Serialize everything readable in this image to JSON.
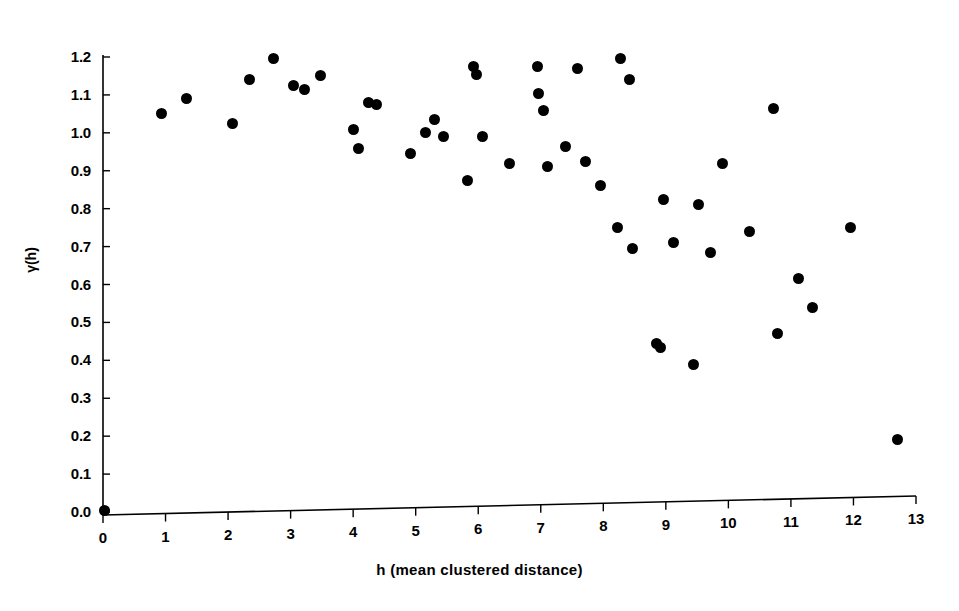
{
  "chart_data": {
    "type": "scatter",
    "title": "",
    "xlabel": "h (mean clustered distance)",
    "ylabel": "γ(h)",
    "xlim": [
      0,
      13
    ],
    "ylim": [
      0.0,
      1.2
    ],
    "grid": false,
    "legend": null,
    "xticks": [
      "0",
      "1",
      "2",
      "3",
      "4",
      "5",
      "6",
      "7",
      "8",
      "9",
      "10",
      "11",
      "12",
      "13"
    ],
    "xtick_values": [
      0,
      1,
      2,
      3,
      4,
      5,
      6,
      7,
      8,
      9,
      10,
      11,
      12,
      13
    ],
    "yticks": [
      "0.0",
      "0.1",
      "0.2",
      "0.3",
      "0.4",
      "0.5",
      "0.6",
      "0.7",
      "0.8",
      "0.9",
      "1.0",
      "1.1",
      "1.2"
    ],
    "ytick_values": [
      0.0,
      0.1,
      0.2,
      0.3,
      0.4,
      0.5,
      0.6,
      0.7,
      0.8,
      0.9,
      1.0,
      1.1,
      1.2
    ],
    "marker": "filled-circle",
    "marker_color": "#000000",
    "points": [
      {
        "x": 0.02,
        "y": 0.005
      },
      {
        "x": 0.93,
        "y": 1.05
      },
      {
        "x": 1.33,
        "y": 1.09
      },
      {
        "x": 2.07,
        "y": 1.025
      },
      {
        "x": 2.34,
        "y": 1.14
      },
      {
        "x": 2.72,
        "y": 1.195
      },
      {
        "x": 3.05,
        "y": 1.125
      },
      {
        "x": 3.22,
        "y": 1.115
      },
      {
        "x": 3.48,
        "y": 1.15
      },
      {
        "x": 4.0,
        "y": 1.01
      },
      {
        "x": 4.08,
        "y": 0.96
      },
      {
        "x": 4.25,
        "y": 1.08
      },
      {
        "x": 4.38,
        "y": 1.075
      },
      {
        "x": 4.92,
        "y": 0.945
      },
      {
        "x": 5.15,
        "y": 1.0
      },
      {
        "x": 5.3,
        "y": 1.035
      },
      {
        "x": 5.45,
        "y": 0.99
      },
      {
        "x": 5.83,
        "y": 0.875
      },
      {
        "x": 5.93,
        "y": 1.175
      },
      {
        "x": 5.98,
        "y": 1.155
      },
      {
        "x": 6.07,
        "y": 0.99
      },
      {
        "x": 6.5,
        "y": 0.92
      },
      {
        "x": 6.95,
        "y": 1.175
      },
      {
        "x": 6.97,
        "y": 1.105
      },
      {
        "x": 7.05,
        "y": 1.06
      },
      {
        "x": 7.1,
        "y": 0.91
      },
      {
        "x": 7.4,
        "y": 0.965
      },
      {
        "x": 7.58,
        "y": 1.17
      },
      {
        "x": 7.72,
        "y": 0.925
      },
      {
        "x": 7.95,
        "y": 0.86
      },
      {
        "x": 8.23,
        "y": 0.75
      },
      {
        "x": 8.28,
        "y": 1.195
      },
      {
        "x": 8.42,
        "y": 1.14
      },
      {
        "x": 8.47,
        "y": 0.695
      },
      {
        "x": 8.85,
        "y": 0.445
      },
      {
        "x": 8.92,
        "y": 0.435
      },
      {
        "x": 8.97,
        "y": 0.825
      },
      {
        "x": 9.12,
        "y": 0.71
      },
      {
        "x": 9.45,
        "y": 0.39
      },
      {
        "x": 9.52,
        "y": 0.81
      },
      {
        "x": 9.72,
        "y": 0.685
      },
      {
        "x": 9.9,
        "y": 0.92
      },
      {
        "x": 10.33,
        "y": 0.74
      },
      {
        "x": 10.72,
        "y": 1.065
      },
      {
        "x": 10.78,
        "y": 0.47
      },
      {
        "x": 11.12,
        "y": 0.615
      },
      {
        "x": 11.35,
        "y": 0.54
      },
      {
        "x": 11.95,
        "y": 0.75
      },
      {
        "x": 12.7,
        "y": 0.19
      }
    ]
  },
  "axes": {
    "x_axis_line_color": "#000000",
    "y_axis_line_color": "#000000"
  }
}
